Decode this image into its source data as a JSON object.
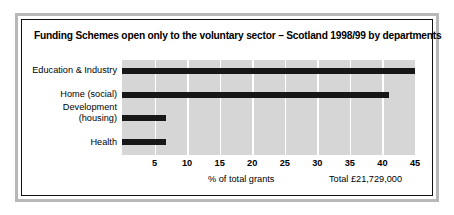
{
  "chart_data": {
    "type": "bar",
    "orientation": "horizontal",
    "title": "Funding Schemes open only to the voluntary sector – Scotland 1998/99 by departments",
    "categories": [
      "Education & Industry",
      "Home (social)",
      "Development (housing)",
      "Health"
    ],
    "values": [
      45,
      41,
      6.7,
      6.7
    ],
    "xlabel": "% of total grants",
    "ylabel": "",
    "xlim": [
      0,
      45
    ],
    "xticks": [
      5,
      10,
      15,
      20,
      25,
      30,
      35,
      40,
      45
    ],
    "xtick_labels": [
      "5",
      "10",
      "15",
      "20",
      "25",
      "30",
      "35",
      "40",
      "45"
    ],
    "grid": true,
    "grid_orientation": "vertical",
    "legend": false,
    "annotations": [
      "Total £21,729,000"
    ],
    "colors": {
      "bar": "#171717",
      "plot_background": "#d6d6d6",
      "gridline": "#ffffff",
      "frame_outer": "#b8b8b8",
      "frame_inner": "#111111",
      "text": "#000000"
    }
  },
  "footer": {
    "axis_caption": "% of total grants",
    "total_caption": "Total £21,729,000"
  },
  "category_labels": [
    {
      "line1": "Education & Industry",
      "line2": ""
    },
    {
      "line1": "Home (social)",
      "line2": ""
    },
    {
      "line1": "Development",
      "line2": "(housing)"
    },
    {
      "line1": "Health",
      "line2": ""
    }
  ]
}
